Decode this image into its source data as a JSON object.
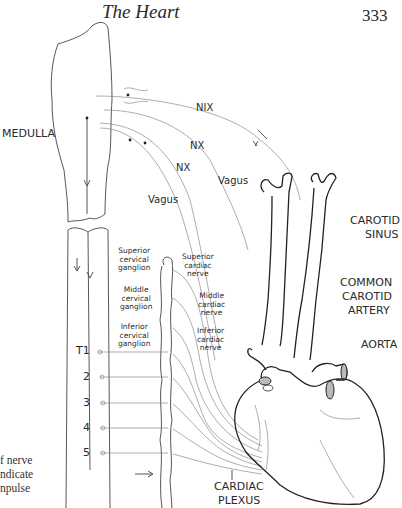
{
  "header": {
    "title": "The Heart",
    "page_number": "333"
  },
  "labels": {
    "medulla": "MEDULLA",
    "nix": "NIX",
    "nx_1": "NX",
    "nx_2": "NX",
    "vagus_1": "Vagus",
    "vagus_2": "Vagus",
    "carotid_sinus_1": "CAROTID",
    "carotid_sinus_2": "SINUS",
    "common_carotid_1": "COMMON",
    "common_carotid_2": "CAROTID",
    "common_carotid_3": "ARTERY",
    "aorta": "AORTA",
    "cardiac_plexus_1": "CARDIAC",
    "cardiac_plexus_2": "PLEXUS",
    "superior_cervical_ganglion": [
      "Superior",
      "cervical",
      "ganglion"
    ],
    "middle_cervical_ganglion": [
      "Middle",
      "cervical",
      "ganglion"
    ],
    "inferior_cervical_ganglion": [
      "Inferior",
      "cervical",
      "ganglion"
    ],
    "superior_cardiac_nerve": [
      "Superior",
      "cardiac",
      "nerve"
    ],
    "middle_cardiac_nerve": [
      "Middle",
      "cardiac",
      "nerve"
    ],
    "inferior_cardiac_nerve": [
      "Inferior",
      "cardiac",
      "nerve"
    ]
  },
  "spinal_segments": [
    "T1",
    "2",
    "3",
    "4",
    "5"
  ],
  "caption": [
    "f nerve",
    "ndicate",
    "npulse"
  ]
}
